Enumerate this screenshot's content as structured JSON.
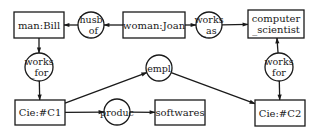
{
  "diagram": {
    "type": "conceptual-graph",
    "concepts": [
      {
        "id": "bill",
        "lines": [
          "man:Bill"
        ]
      },
      {
        "id": "joan",
        "lines": [
          "woman:Joan"
        ]
      },
      {
        "id": "cs",
        "lines": [
          "computer",
          "_scientist"
        ]
      },
      {
        "id": "c1",
        "lines": [
          "Cie:#C1"
        ]
      },
      {
        "id": "soft",
        "lines": [
          "softwares"
        ]
      },
      {
        "id": "c2",
        "lines": [
          "Cie:#C2"
        ]
      }
    ],
    "relations": [
      {
        "id": "husb",
        "lines": [
          "husb",
          "_of"
        ]
      },
      {
        "id": "worksas",
        "lines": [
          "works",
          "_as"
        ]
      },
      {
        "id": "wf1",
        "lines": [
          "works",
          "_for"
        ]
      },
      {
        "id": "wf2",
        "lines": [
          "works",
          "for"
        ]
      },
      {
        "id": "empl",
        "lines": [
          "empl"
        ]
      },
      {
        "id": "produc",
        "lines": [
          "produc"
        ]
      }
    ],
    "edges": [
      {
        "from": "joan",
        "to": "husb"
      },
      {
        "from": "husb",
        "to": "bill"
      },
      {
        "from": "joan",
        "to": "worksas"
      },
      {
        "from": "worksas",
        "to": "cs"
      },
      {
        "from": "bill",
        "to": "wf1"
      },
      {
        "from": "wf1",
        "to": "c1"
      },
      {
        "from": "wf2",
        "to": "cs"
      },
      {
        "from": "wf2",
        "to": "c2"
      },
      {
        "from": "c1",
        "to": "empl"
      },
      {
        "from": "empl",
        "to": "c2"
      },
      {
        "from": "c1",
        "to": "produc"
      },
      {
        "from": "produc",
        "to": "soft"
      }
    ]
  }
}
